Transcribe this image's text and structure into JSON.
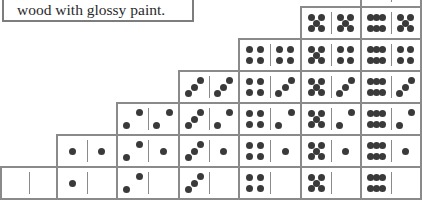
{
  "caption": {
    "text": "wood with glossy paint."
  },
  "layout": {
    "col_x": [
      0,
      56,
      116,
      178,
      238,
      300,
      360,
      420
    ],
    "row_bottom": 198,
    "row_height": 32
  },
  "colors": {
    "border": "#8a8a8a",
    "pip": "#3a3a3a",
    "text": "#2a2a2a"
  },
  "dominoes": {
    "description": "Staircase of a double-six domino set; column N holds tiles N|0 .. N|N from bottom to top",
    "columns": [
      {
        "suit": 0,
        "tiles": [
          [
            0,
            0
          ]
        ]
      },
      {
        "suit": 1,
        "tiles": [
          [
            1,
            0
          ],
          [
            1,
            1
          ]
        ]
      },
      {
        "suit": 2,
        "tiles": [
          [
            2,
            0
          ],
          [
            2,
            1
          ],
          [
            2,
            2
          ]
        ]
      },
      {
        "suit": 3,
        "tiles": [
          [
            3,
            0
          ],
          [
            3,
            1
          ],
          [
            3,
            2
          ],
          [
            3,
            3
          ]
        ]
      },
      {
        "suit": 4,
        "tiles": [
          [
            4,
            0
          ],
          [
            4,
            1
          ],
          [
            4,
            2
          ],
          [
            4,
            3
          ],
          [
            4,
            4
          ]
        ]
      },
      {
        "suit": 5,
        "tiles": [
          [
            5,
            0
          ],
          [
            5,
            1
          ],
          [
            5,
            2
          ],
          [
            5,
            3
          ],
          [
            5,
            4
          ],
          [
            5,
            5
          ]
        ]
      },
      {
        "suit": 6,
        "tiles": [
          [
            6,
            0
          ],
          [
            6,
            1
          ],
          [
            6,
            2
          ],
          [
            6,
            3
          ],
          [
            6,
            4
          ],
          [
            6,
            5
          ],
          [
            6,
            6
          ]
        ]
      }
    ]
  }
}
